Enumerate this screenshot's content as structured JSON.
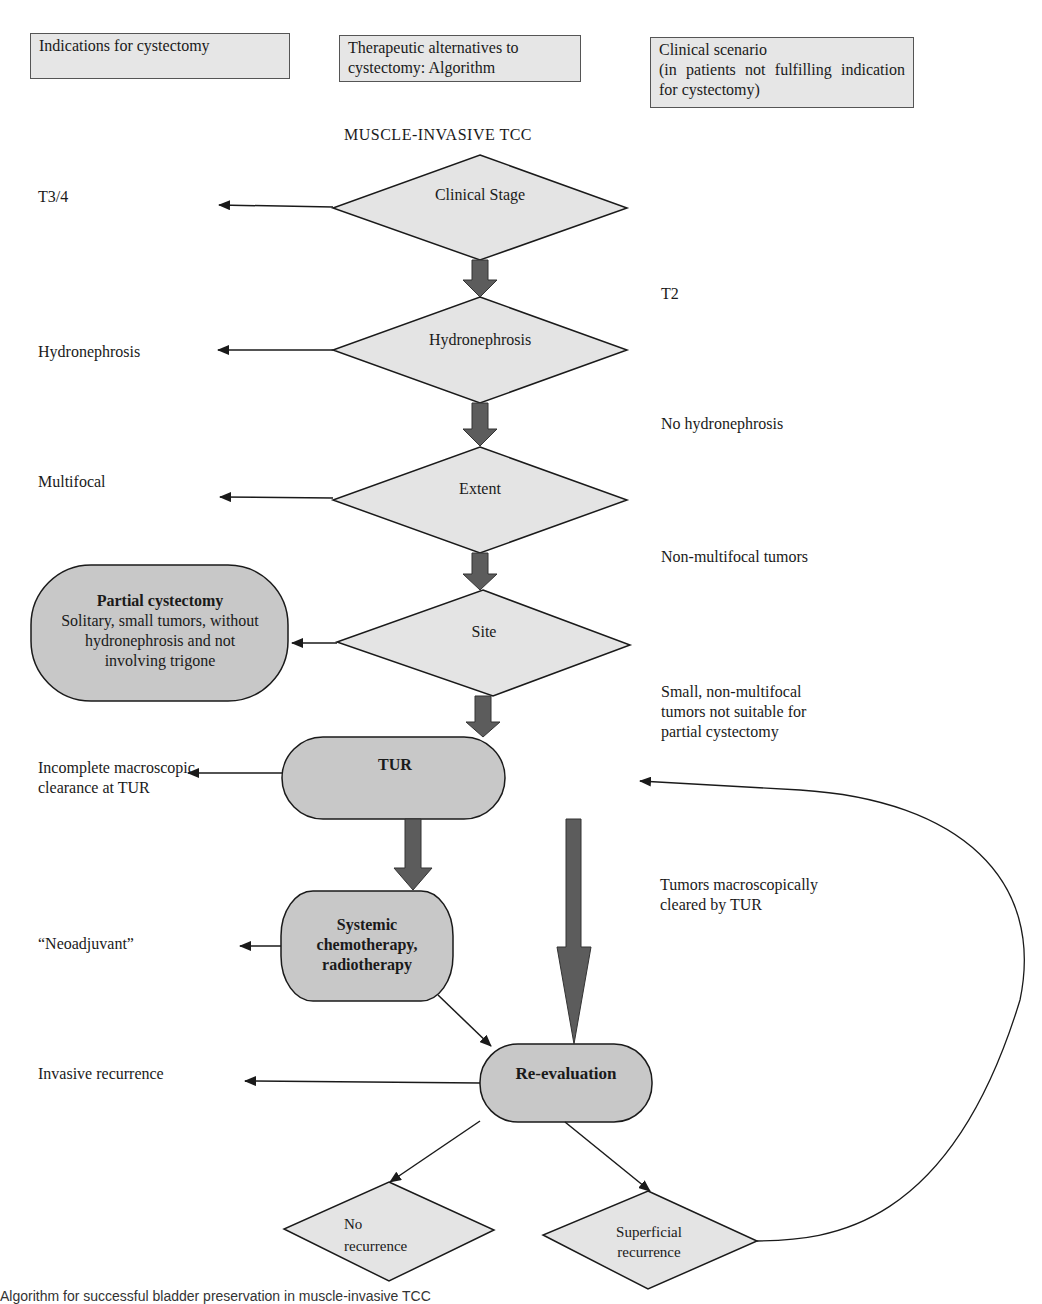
{
  "headers": {
    "col1": "Indications for cystectomy",
    "col2": "Therapeutic alternatives to cystectomy: Algorithm",
    "col3_line1": "Clinical scenario",
    "col3_line2": "(in patients not fulfilling indication for cystectomy)"
  },
  "title": "MUSCLE-INVASIVE TCC",
  "nodes": {
    "clinical_stage": "Clinical Stage",
    "hydronephrosis": "Hydronephrosis",
    "extent": "Extent",
    "site": "Site",
    "tur": "TUR",
    "partial_cystectomy_title": "Partial cystectomy",
    "partial_cystectomy_desc": "Solitary, small tumors, without hydronephrosis and not involving trigone",
    "systemic_title": "Systemic chemotherapy, radiotherapy",
    "re_evaluation": "Re-evaluation",
    "no_recurrence": "No recurrence",
    "superficial_recurrence": "Superficial recurrence"
  },
  "indications": {
    "t34": "T3/4",
    "hydronephrosis": "Hydronephrosis",
    "multifocal": "Multifocal",
    "incomplete_line1": "Incomplete macroscopic",
    "incomplete_line2": "clearance at TUR",
    "neoadjuvant": "“Neoadjuvant”",
    "invasive_recurrence": "Invasive recurrence"
  },
  "scenarios": {
    "t2": "T2",
    "no_hydronephrosis": "No hydronephrosis",
    "non_multifocal": "Non-multifocal tumors",
    "small_line1": "Small, non-multifocal",
    "small_line2": "tumors not suitable for",
    "small_line3": "partial cystectomy",
    "cleared_line1": "Tumors macroscopically",
    "cleared_line2": "cleared by TUR"
  },
  "caption": "Algorithm for successful bladder preservation in muscle-invasive TCC",
  "colors": {
    "diamond_fill": "#e4e4e4",
    "rounded_fill": "#c8c8c8",
    "header_fill": "#e6e6e6",
    "thick_arrow": "#5c5c5c",
    "stroke": "#1a1a1a"
  }
}
